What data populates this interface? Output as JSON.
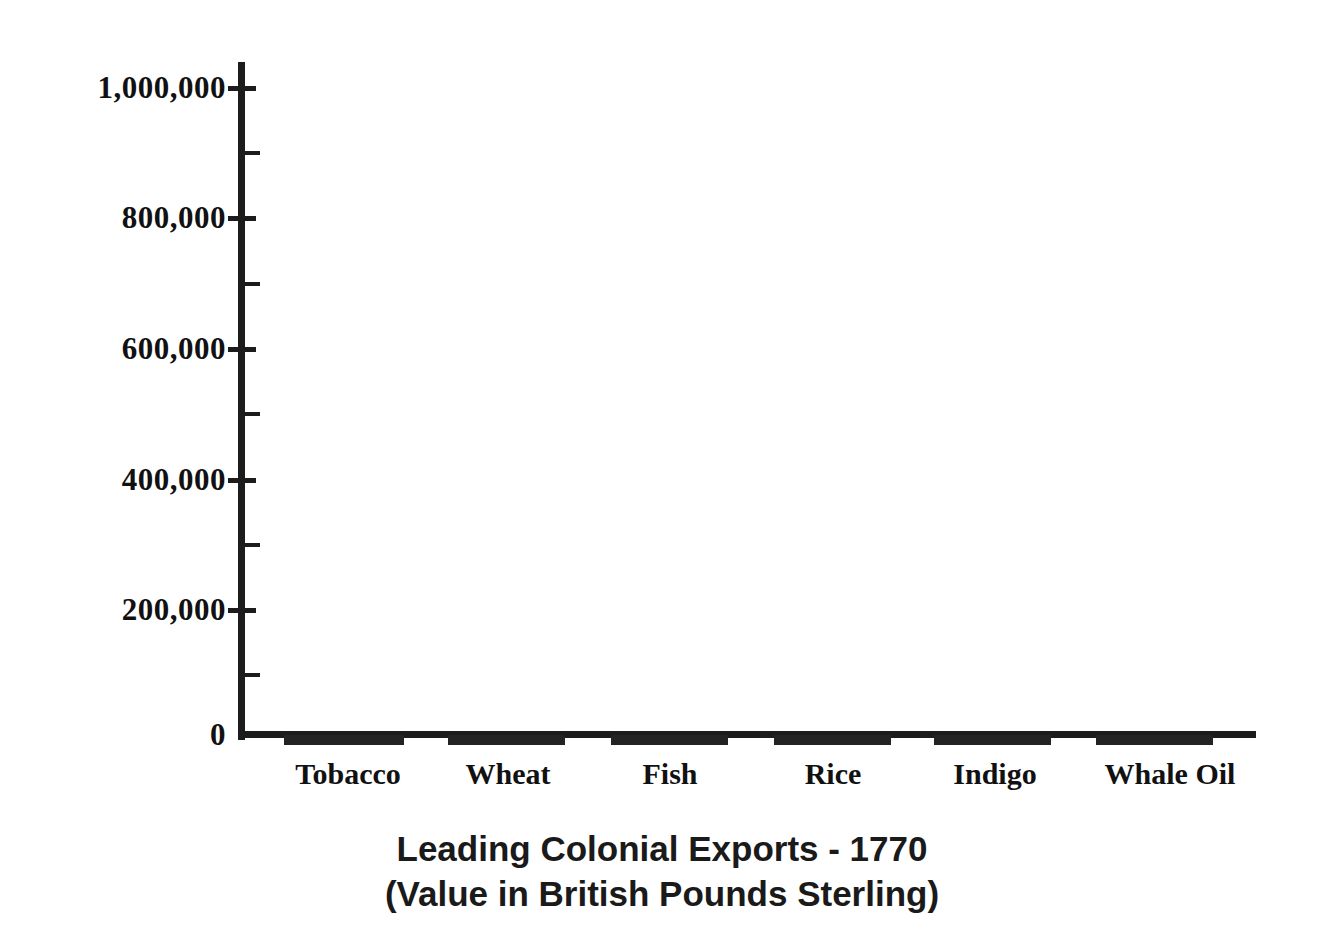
{
  "chart_data": {
    "type": "bar",
    "title": "Leading Colonial Exports - 1770",
    "subtitle": "(Value in British Pounds Sterling)",
    "xlabel": "",
    "ylabel": "",
    "categories": [
      "Tobacco",
      "Wheat",
      "Fish",
      "Rice",
      "Indigo",
      "Whale Oil"
    ],
    "values": [
      0,
      0,
      0,
      0,
      0,
      0
    ],
    "ylim": [
      0,
      1000000
    ],
    "ytick_labels": [
      "1,000,000",
      "800,000",
      "600,000",
      "400,000",
      "200,000",
      "0"
    ],
    "ytick_values": [
      1000000,
      800000,
      600000,
      400000,
      200000,
      0
    ],
    "yminor_values": [
      900000,
      700000,
      500000,
      300000,
      100000
    ],
    "grid": false,
    "legend": null
  },
  "axes": {
    "y_ticks": [
      {
        "label": "1,000,000",
        "value": 1000000,
        "top": 88,
        "major": true
      },
      {
        "label": "",
        "value": 900000,
        "top": 153,
        "major": false
      },
      {
        "label": "800,000",
        "value": 800000,
        "top": 218,
        "major": true
      },
      {
        "label": "",
        "value": 700000,
        "top": 284,
        "major": false
      },
      {
        "label": "600,000",
        "value": 600000,
        "top": 349,
        "major": true
      },
      {
        "label": "",
        "value": 500000,
        "top": 414,
        "major": false
      },
      {
        "label": "400,000",
        "value": 400000,
        "top": 480,
        "major": true
      },
      {
        "label": "",
        "value": 300000,
        "top": 545,
        "major": false
      },
      {
        "label": "200,000",
        "value": 200000,
        "top": 610,
        "major": true
      },
      {
        "label": "",
        "value": 100000,
        "top": 675,
        "major": false
      },
      {
        "label": "0",
        "value": 0,
        "top": 735,
        "major": false
      }
    ],
    "bars": [
      {
        "label": "Tobacco",
        "value": 0,
        "left": 284,
        "width": 120,
        "label_center": 348
      },
      {
        "label": "Wheat",
        "value": 0,
        "left": 448,
        "width": 117,
        "label_center": 508
      },
      {
        "label": "Fish",
        "value": 0,
        "left": 611,
        "width": 117,
        "label_center": 670
      },
      {
        "label": "Rice",
        "value": 0,
        "left": 774,
        "width": 117,
        "label_center": 833
      },
      {
        "label": "Indigo",
        "value": 0,
        "left": 934,
        "width": 117,
        "label_center": 995
      },
      {
        "label": "Whale Oil",
        "value": 0,
        "left": 1096,
        "width": 117,
        "label_center": 1170
      }
    ]
  },
  "title": {
    "line1": "Leading Colonial Exports - 1770",
    "line2": "(Value in British Pounds Sterling)"
  },
  "colors": {
    "ink": "#1c1c1c",
    "bar": "#232323",
    "background": "#ffffff"
  }
}
